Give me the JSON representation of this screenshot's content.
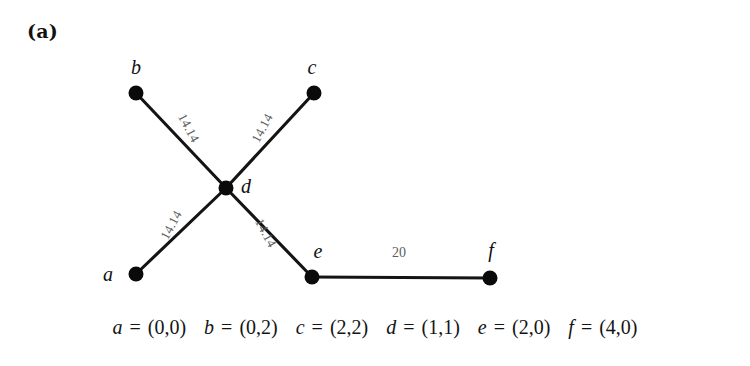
{
  "figure": {
    "panel_label": "(a)",
    "background_color": "#ffffff",
    "node_color": "#0a0a0a",
    "edge_color": "#141414",
    "edge_label_color": "#5d5d5d"
  },
  "chart_data": {
    "type": "diagram",
    "title": "(a)",
    "graph_kind": "weighted-geometric-graph",
    "nodes": [
      {
        "id": "a",
        "label": "a",
        "coord_text": "(0,0)",
        "coord": [
          0,
          0
        ],
        "px": [
          136,
          274
        ],
        "label_px": [
          113,
          281
        ],
        "label_anchor": "end"
      },
      {
        "id": "b",
        "label": "b",
        "coord_text": "(0,2)",
        "coord": [
          0,
          2
        ],
        "px": [
          136,
          93
        ],
        "label_px": [
          136,
          74
        ],
        "label_anchor": "middle"
      },
      {
        "id": "c",
        "label": "c",
        "coord_text": "(2,2)",
        "coord": [
          2,
          2
        ],
        "px": [
          314,
          93
        ],
        "label_px": [
          312,
          74
        ],
        "label_anchor": "middle"
      },
      {
        "id": "d",
        "label": "d",
        "coord_text": "(1,1)",
        "coord": [
          1,
          1
        ],
        "px": [
          226,
          188
        ],
        "label_px": [
          241,
          193
        ],
        "label_anchor": "start"
      },
      {
        "id": "e",
        "label": "e",
        "coord_text": "(2,0)",
        "coord": [
          2,
          0
        ],
        "px": [
          312,
          277
        ],
        "label_px": [
          318,
          258
        ],
        "label_anchor": "middle"
      },
      {
        "id": "f",
        "label": "f",
        "coord_text": "(4,0)",
        "coord": [
          4,
          0
        ],
        "px": [
          490,
          278
        ],
        "label_px": [
          491,
          257
        ],
        "label_anchor": "middle"
      }
    ],
    "edges": [
      {
        "source": "b",
        "target": "d",
        "weight_text": "14.14",
        "weight": 14.14,
        "label_px": [
          185,
          130
        ],
        "label_rotation": 62
      },
      {
        "source": "c",
        "target": "d",
        "weight_text": "14.14",
        "weight": 14.14,
        "label_px": [
          266,
          130
        ],
        "label_rotation": -62
      },
      {
        "source": "a",
        "target": "d",
        "weight_text": "14.14",
        "weight": 14.14,
        "label_px": [
          175,
          227
        ],
        "label_rotation": -62
      },
      {
        "source": "d",
        "target": "e",
        "weight_text": "14.14",
        "weight": 14.14,
        "label_px": [
          262,
          235
        ],
        "label_rotation": 62
      },
      {
        "source": "e",
        "target": "f",
        "weight_text": "20",
        "weight": 20,
        "label_px": [
          399,
          257
        ],
        "label_rotation": 0
      }
    ],
    "node_radius_px": 7.5,
    "xlabel": "",
    "ylabel": "",
    "grid": false,
    "legend": false
  },
  "caption": {
    "entries": [
      {
        "var": "a",
        "eq": "=",
        "pair": "(0,0)"
      },
      {
        "var": "b",
        "eq": "=",
        "pair": "(0,2)"
      },
      {
        "var": "c",
        "eq": "=",
        "pair": "(2,2)"
      },
      {
        "var": "d",
        "eq": "=",
        "pair": "(1,1)"
      },
      {
        "var": "e",
        "eq": "=",
        "pair": "(2,0)"
      },
      {
        "var": "f",
        "eq": "=",
        "pair": "(4,0)"
      }
    ]
  }
}
